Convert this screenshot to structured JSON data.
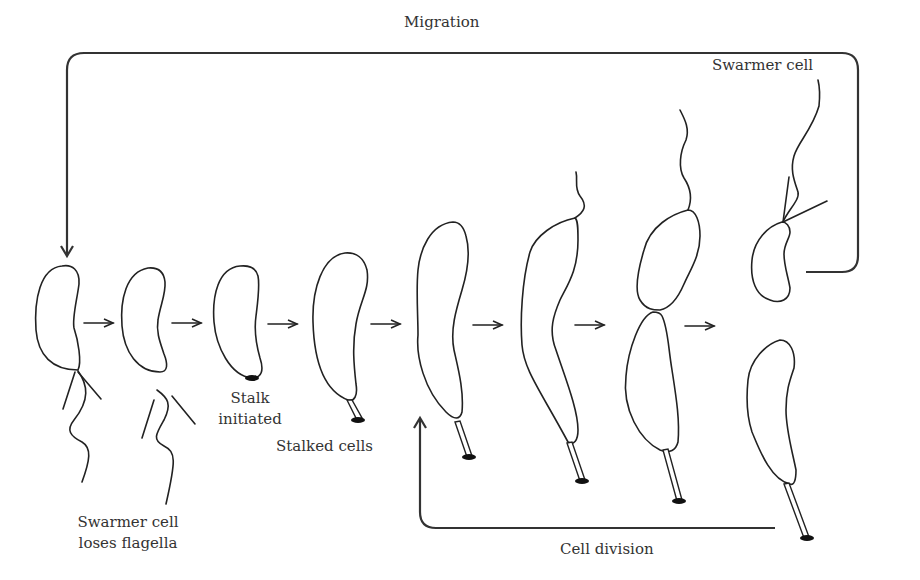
{
  "diagram": {
    "labels": {
      "migration": "Migration",
      "swarmer_cell_top": "Swarmer cell",
      "swarmer_loses_line1": "Swarmer cell",
      "swarmer_loses_line2": "loses flagella",
      "stalk_initiated_line1": "Stalk",
      "stalk_initiated_line2": "initiated",
      "stalked_cells": "Stalked cells",
      "cell_division": "Cell division"
    },
    "stages": [
      {
        "id": 1,
        "name": "Swarmer cell with flagella",
        "features": [
          "flagellum",
          "pili"
        ]
      },
      {
        "id": 2,
        "name": "Swarmer cell loses flagella",
        "features": [
          "shed flagellum",
          "shed pili"
        ]
      },
      {
        "id": 3,
        "name": "Stalk initiated",
        "features": [
          "holdfast"
        ]
      },
      {
        "id": 4,
        "name": "Stalked cell",
        "features": [
          "stalk",
          "holdfast"
        ]
      },
      {
        "id": 5,
        "name": "Elongating stalked cell",
        "features": [
          "stalk",
          "holdfast"
        ]
      },
      {
        "id": 6,
        "name": "Predivisional cell with new flagellum",
        "features": [
          "stalk",
          "holdfast",
          "flagellum"
        ]
      },
      {
        "id": 7,
        "name": "Constricting predivisional cell",
        "features": [
          "stalk",
          "holdfast",
          "flagellum",
          "constriction"
        ]
      },
      {
        "id": 8,
        "name": "Daughter cells: swarmer + stalked",
        "features": [
          "flagellum",
          "pili",
          "stalk",
          "holdfast"
        ]
      }
    ],
    "arrows": [
      {
        "from": 1,
        "to": 2,
        "type": "progression"
      },
      {
        "from": 2,
        "to": 3,
        "type": "progression"
      },
      {
        "from": 3,
        "to": 4,
        "type": "progression"
      },
      {
        "from": 4,
        "to": 5,
        "type": "progression"
      },
      {
        "from": 5,
        "to": 6,
        "type": "progression"
      },
      {
        "from": 6,
        "to": 7,
        "type": "progression"
      },
      {
        "from": 7,
        "to": 8,
        "type": "progression"
      },
      {
        "from": "8-swarmer",
        "to": 1,
        "type": "cycle",
        "label": "Migration"
      },
      {
        "from": "8-stalked",
        "to": 5,
        "type": "cycle",
        "label": "Cell division"
      }
    ],
    "colors": {
      "stroke": "#222222",
      "text": "#333333",
      "background": "#ffffff"
    }
  }
}
